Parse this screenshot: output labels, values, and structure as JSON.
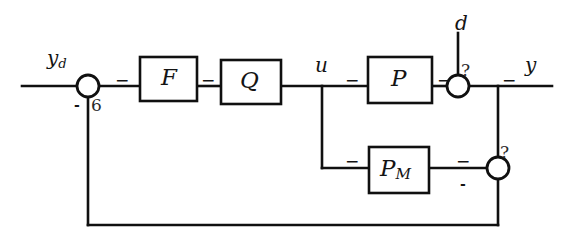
{
  "diagram": {
    "kind": "block-diagram",
    "background_color": "#ffffff",
    "line_color": "#101010",
    "blocks": [
      {
        "id": "F",
        "label": "F",
        "x": 140,
        "y": 57,
        "w": 57,
        "h": 44
      },
      {
        "id": "Q",
        "label": "Q",
        "x": 221,
        "y": 60,
        "w": 60,
        "h": 44
      },
      {
        "id": "P",
        "label": "P",
        "x": 368,
        "y": 57,
        "w": 64,
        "h": 46
      },
      {
        "id": "PM",
        "label": "P",
        "sublabel": "M",
        "x": 369,
        "y": 147,
        "w": 60,
        "h": 46
      }
    ],
    "junctions": [
      {
        "id": "sum-input",
        "cx": 88,
        "cy": 86,
        "r": 11
      },
      {
        "id": "sum-disturbance",
        "cx": 458,
        "cy": 86,
        "r": 11
      },
      {
        "id": "sum-model-error",
        "cx": 498,
        "cy": 168,
        "r": 11
      }
    ],
    "signals": [
      {
        "id": "reference",
        "label": "y",
        "sublabel": "d",
        "x": 47,
        "y": 48
      },
      {
        "id": "control",
        "label": "u",
        "x": 315,
        "y": 55
      },
      {
        "id": "disturbance",
        "label": "d",
        "x": 455,
        "y": 13
      },
      {
        "id": "output",
        "label": "y",
        "x": 525,
        "y": 55
      }
    ],
    "sign_marks": [
      {
        "id": "sum-input-minus-left",
        "text": "-",
        "x": 74,
        "y": 98,
        "style": "small"
      },
      {
        "id": "sum-input-mark-right",
        "text": "6",
        "x": 91,
        "y": 97,
        "style": "glyph"
      },
      {
        "id": "wire-mark-before-F",
        "text": "−",
        "x": 115,
        "y": 72,
        "style": "dash"
      },
      {
        "id": "wire-mark-before-Q",
        "text": "−",
        "x": 201,
        "y": 72,
        "style": "dash"
      },
      {
        "id": "wire-mark-before-P",
        "text": "−",
        "x": 345,
        "y": 72,
        "style": "dash"
      },
      {
        "id": "wire-mark-after-P",
        "text": "−",
        "x": 437,
        "y": 72,
        "style": "dash"
      },
      {
        "id": "sum-disturbance-mark",
        "text": "?",
        "x": 461,
        "y": 62,
        "style": "glyph"
      },
      {
        "id": "wire-mark-output",
        "text": "−",
        "x": 502,
        "y": 72,
        "style": "dash"
      },
      {
        "id": "wire-mark-before-PM",
        "text": "−",
        "x": 345,
        "y": 153,
        "style": "dash"
      },
      {
        "id": "wire-mark-after-PM",
        "text": "−",
        "x": 456,
        "y": 153,
        "style": "dash"
      },
      {
        "id": "sum-model-minus-left",
        "text": "-",
        "x": 460,
        "y": 177,
        "style": "small"
      },
      {
        "id": "sum-model-mark-top",
        "text": "?",
        "x": 500,
        "y": 144,
        "style": "glyph"
      }
    ],
    "wires": [
      {
        "id": "reference-into-sum",
        "path": "M22,86 L77,86"
      },
      {
        "id": "sum-to-F",
        "path": "M99,86 L140,86"
      },
      {
        "id": "F-to-Q",
        "path": "M197,86 L221,86"
      },
      {
        "id": "Q-to-u-node",
        "path": "M281,86 L368,86"
      },
      {
        "id": "u-branch-down",
        "path": "M322,86 L322,168"
      },
      {
        "id": "u-branch-to-PM",
        "path": "M322,168 L369,168"
      },
      {
        "id": "P-to-disturbance-sum",
        "path": "M432,86 L447,86"
      },
      {
        "id": "disturbance-into-sum",
        "path": "M458,33 L458,75"
      },
      {
        "id": "sum-to-output",
        "path": "M469,86 L552,86"
      },
      {
        "id": "output-branch-down",
        "path": "M498,86 L498,157"
      },
      {
        "id": "PM-to-model-sum",
        "path": "M429,168 L487,168"
      },
      {
        "id": "model-sum-down",
        "path": "M498,179 L498,225"
      },
      {
        "id": "feedback-bottom",
        "path": "M498,225 L88,225"
      },
      {
        "id": "feedback-up-to-sum",
        "path": "M88,225 L88,97"
      }
    ]
  }
}
